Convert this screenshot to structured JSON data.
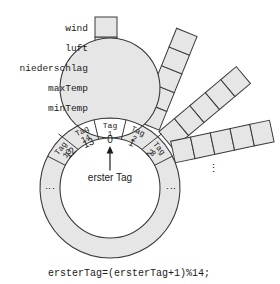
{
  "figure": {
    "field_labels": [
      "wind",
      "luft",
      "niederschlag",
      "maxTemp",
      "minTemp"
    ],
    "ring": {
      "segment_labels": [
        {
          "line1": "Tag",
          "line2": "13"
        },
        {
          "line1": "Tag",
          "line2": "14"
        },
        {
          "line1": "Tag",
          "line2": "1"
        },
        {
          "line1": "Tag",
          "line2": "2"
        },
        {
          "line1": "Tag",
          "line2": "3"
        }
      ],
      "index_labels": [
        "12",
        "13",
        "0",
        "1",
        "2"
      ],
      "ellipsis_left": "⋮",
      "ellipsis_right": "⋮"
    },
    "pointer": {
      "label": "erster Tag"
    },
    "columns": [
      {
        "name": "column-tag-1",
        "cells": 5
      },
      {
        "name": "column-tag-2",
        "cells": 5
      },
      {
        "name": "column-tag-3",
        "cells": 5
      },
      {
        "name": "column-tag-4",
        "cells": 5
      }
    ],
    "column_ellipsis": "⋮",
    "caption": "ersterTag=(ersterTag+1)%14;",
    "colors": {
      "cell_fill": "#e6e6e6",
      "cell_stroke": "#3a3a3a",
      "text": "#1a1a1a",
      "background": "#ffffff"
    }
  }
}
